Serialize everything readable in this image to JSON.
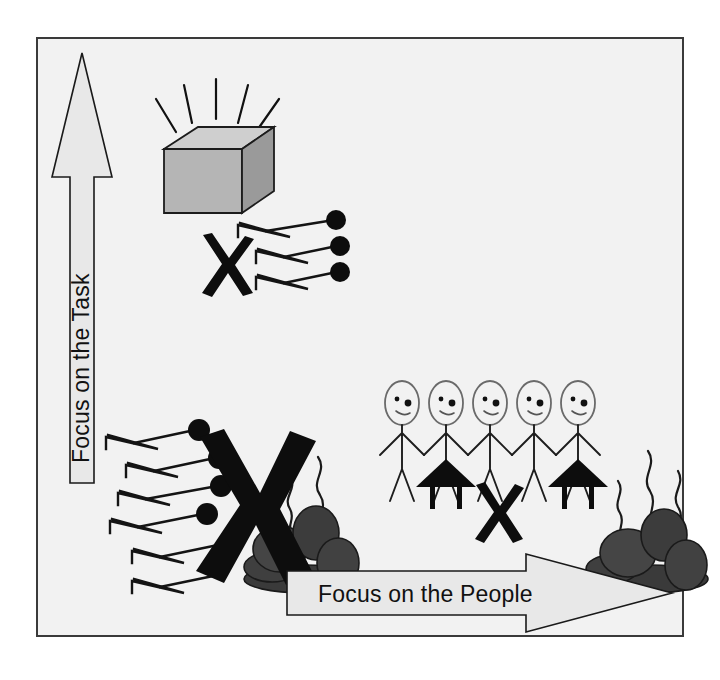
{
  "diagram": {
    "type": "2x2-leadership-grid",
    "style": "hand-drawn sketch, black and white with gray fills",
    "frame": {
      "background_color": "#f2f2f2",
      "border_color": "#3a3a3a"
    },
    "axes": {
      "vertical": {
        "name": "vertical-axis-arrow",
        "label": "Focus on the Task",
        "direction": "up",
        "fill_color": "#e8e8e8",
        "outline_color": "#1a1a1a"
      },
      "horizontal": {
        "name": "horizontal-axis-arrow",
        "label": "Focus on the People",
        "direction": "right",
        "fill_color": "#e8e8e8",
        "outline_color": "#1a1a1a"
      }
    },
    "quadrants": [
      {
        "id": "top-left",
        "name": "high-task-low-people",
        "elements": [
          {
            "name": "shining-cube-icon",
            "label": "shining cube",
            "fill_color": "#b3b3b3",
            "ray_count": 5
          },
          {
            "name": "pin-cluster-icon",
            "label": "pins with heads",
            "count": 3,
            "dot_color": "#0d0d0d"
          },
          {
            "name": "x-mark-small",
            "label": "X",
            "color": "#0d0d0d"
          }
        ]
      },
      {
        "id": "bottom-left",
        "name": "low-task-low-people",
        "elements": [
          {
            "name": "pin-cluster-icon",
            "label": "pins with heads",
            "count": 6,
            "dot_color": "#0d0d0d"
          },
          {
            "name": "x-mark-large",
            "label": "X",
            "color": "#0d0d0d"
          },
          {
            "name": "rock-pile-icon",
            "label": "smoking rock pile",
            "fill_color": "#3d3d3d",
            "smoke_lines": 2
          }
        ]
      },
      {
        "id": "bottom-right",
        "name": "low-task-high-people",
        "elements": [
          {
            "name": "stick-figure-group",
            "label": "people holding hands",
            "count": 5,
            "outline_color": "#555555"
          },
          {
            "name": "tent-icon",
            "label": "black triangle on legs",
            "count": 2,
            "color": "#0d0d0d"
          },
          {
            "name": "x-mark-small",
            "label": "X",
            "color": "#0d0d0d"
          },
          {
            "name": "rock-pile-icon",
            "label": "smoking rock pile",
            "fill_color": "#3d3d3d",
            "smoke_lines": 3
          }
        ]
      }
    ],
    "marks": {
      "x_glyph": "X"
    }
  }
}
